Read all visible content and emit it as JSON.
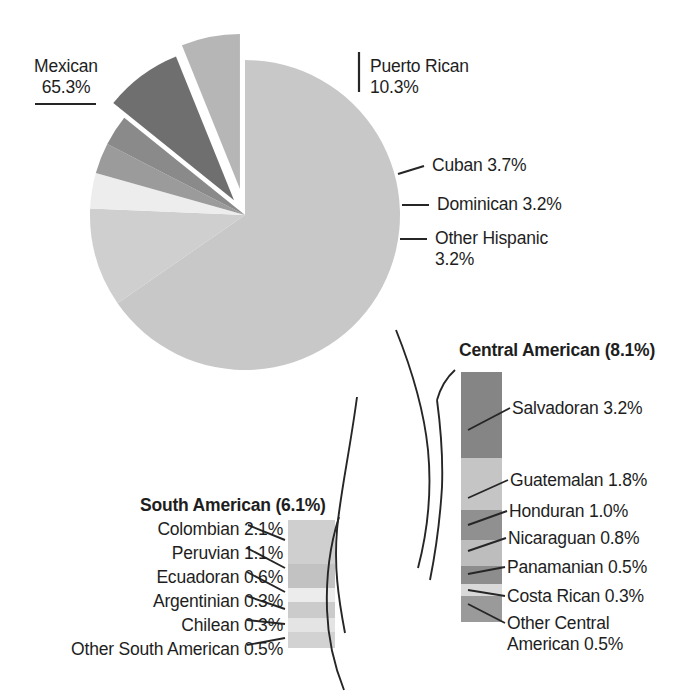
{
  "chart_data": {
    "type": "pie",
    "title": "",
    "subtitle": "",
    "xlabel": "",
    "ylabel": "",
    "grid": false,
    "legend_position": "callout-labels",
    "units": "percent",
    "categories": [
      "Mexican",
      "Puerto Rican",
      "Cuban",
      "Dominican",
      "Other Hispanic",
      "Central American",
      "South American"
    ],
    "values": [
      65.3,
      10.3,
      3.7,
      3.2,
      3.2,
      8.1,
      6.1
    ],
    "colors": [
      "#c8c8c8",
      "#cfcfcf",
      "#ededed",
      "#9b9b9b",
      "#8a8a8a",
      "#6f6f6f",
      "#b6b6b6"
    ],
    "exploded": [
      "Central American",
      "South American"
    ],
    "breakouts": [
      {
        "name": "Central American",
        "total": 8.1,
        "heading": "Central American (8.1%)",
        "items": [
          {
            "label": "Salvadoran 3.2%",
            "name": "Salvadoran",
            "value": 3.2,
            "color": "#858585"
          },
          {
            "label": "Guatemalan 1.8%",
            "name": "Guatemalan",
            "value": 1.8,
            "color": "#c5c5c5"
          },
          {
            "label": "Honduran 1.0%",
            "name": "Honduran",
            "value": 1.0,
            "color": "#909090"
          },
          {
            "label": "Nicaraguan 0.8%",
            "name": "Nicaraguan",
            "value": 0.8,
            "color": "#bdbdbd"
          },
          {
            "label": "Panamanian 0.5%",
            "name": "Panamanian",
            "value": 0.5,
            "color": "#8d8d8d"
          },
          {
            "label": "Costa Rican 0.3%",
            "name": "Costa Rican",
            "value": 0.3,
            "color": "#d9d9d9"
          },
          {
            "label": "Other Central American 0.5%",
            "name": "Other Central American",
            "value": 0.5,
            "color": "#9a9a9a"
          }
        ]
      },
      {
        "name": "South American",
        "total": 6.1,
        "heading": "South American (6.1%)",
        "items": [
          {
            "label": "Colombian 2.1%",
            "name": "Colombian",
            "value": 2.1,
            "color": "#cfcfcf"
          },
          {
            "label": "Peruvian 1.1%",
            "name": "Peruvian",
            "value": 1.1,
            "color": "#c2c2c2"
          },
          {
            "label": "Ecuadoran 0.6%",
            "name": "Ecuadoran",
            "value": 0.6,
            "color": "#ececec"
          },
          {
            "label": "Argentinian 0.3%",
            "name": "Argentinian",
            "value": 0.3,
            "color": "#cbcbcb"
          },
          {
            "label": "Chilean 0.3%",
            "name": "Chilean",
            "value": 0.3,
            "color": "#e4e4e4"
          },
          {
            "label": "Other South American 0.5%",
            "name": "Other South American",
            "value": 0.5,
            "color": "#d2d2d2"
          }
        ]
      }
    ]
  },
  "pie_labels": {
    "mexican_name": "Mexican",
    "mexican_value": "65.3%",
    "puerto_rican_name": "Puerto Rican",
    "puerto_rican_value": "10.3%",
    "cuban": "Cuban 3.7%",
    "dominican": "Dominican 3.2%",
    "other_hispanic_name": "Other Hispanic",
    "other_hispanic_value": "3.2%"
  },
  "central": {
    "heading": "Central American (8.1%)",
    "salvadoran": "Salvadoran 3.2%",
    "guatemalan": "Guatemalan 1.8%",
    "honduran": "Honduran 1.0%",
    "nicaraguan": "Nicaraguan 0.8%",
    "panamanian": "Panamanian 0.5%",
    "costa_rican": "Costa Rican 0.3%",
    "other_line1": "Other Central",
    "other_line2": "American 0.5%"
  },
  "south": {
    "heading": "South American (6.1%)",
    "colombian": "Colombian 2.1%",
    "peruvian": "Peruvian 1.1%",
    "ecuadoran": "Ecuadoran 0.6%",
    "argentinian": "Argentinian 0.3%",
    "chilean": "Chilean 0.3%",
    "other": "Other South American 0.5%"
  },
  "palette": {
    "ink": "#1e1e1e",
    "leader": "#262626",
    "background": "#ffffff"
  }
}
